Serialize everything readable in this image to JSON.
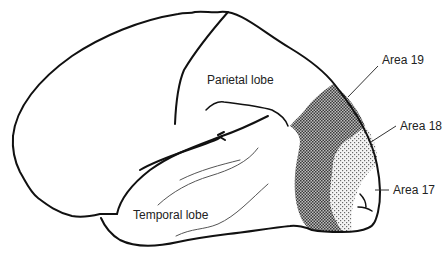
{
  "diagram": {
    "type": "brain-lateral-view",
    "labels": {
      "parietal": "Parietal lobe",
      "temporal": "Temporal lobe",
      "area19": "Area 19",
      "area18": "Area 18",
      "area17": "Area 17"
    },
    "colors": {
      "outline": "#111111",
      "area19_fill": "#8a8a8a",
      "area18_fill": "#d0d0d0",
      "background": "#ffffff"
    }
  }
}
